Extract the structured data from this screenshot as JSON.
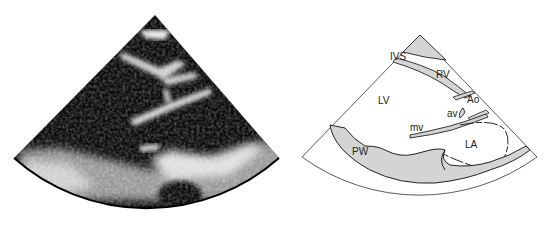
{
  "figure": {
    "left_panel": {
      "kind": "ultrasound image",
      "view": "parasternal long-axis echocardiogram"
    },
    "right_panel": {
      "kind": "labeled schematic",
      "labels": {
        "ivs": "IVS",
        "rv": "RV",
        "lv": "LV",
        "ao": "Ao",
        "av": "av",
        "mv": "mv",
        "la": "LA",
        "pw": "PW"
      },
      "colors": {
        "wall_fill": "#d4d4d4",
        "outline": "#222222"
      }
    }
  }
}
